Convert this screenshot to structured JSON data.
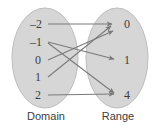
{
  "figure": {
    "type": "mapping-diagram",
    "partial_top_text": "",
    "width": 155,
    "height": 128,
    "background_color": "#ffffff",
    "ellipse_fill": "#d6d6d6",
    "ellipse_stroke": "#bdbdbd",
    "arrow_color": "#7a7a7a",
    "text_color": "#3d3d3d"
  },
  "domain": {
    "caption": "Domain",
    "center_x": 45,
    "center_y": 58,
    "radius_x": 33,
    "radius_y": 50,
    "items": [
      {
        "label": "–2",
        "x": 34,
        "y": 24
      },
      {
        "label": "–1",
        "x": 34,
        "y": 42
      },
      {
        "label": "0",
        "x": 38,
        "y": 60
      },
      {
        "label": "1",
        "x": 38,
        "y": 77
      },
      {
        "label": "2",
        "x": 38,
        "y": 95
      }
    ]
  },
  "range": {
    "caption": "Range",
    "center_x": 117,
    "center_y": 58,
    "radius_x": 31,
    "radius_y": 50,
    "items": [
      {
        "label": "0",
        "x": 126,
        "y": 24
      },
      {
        "label": "1",
        "x": 126,
        "y": 60
      },
      {
        "label": "4",
        "x": 126,
        "y": 95
      }
    ]
  },
  "mappings": [
    {
      "from": "–2",
      "to": "0",
      "x1": 48,
      "y1": 24,
      "x2": 116,
      "y2": 24
    },
    {
      "from": "–1",
      "to": "1",
      "x1": 48,
      "y1": 42,
      "x2": 118,
      "y2": 60
    },
    {
      "from": "0",
      "to": "0",
      "x1": 48,
      "y1": 60,
      "x2": 116,
      "y2": 32
    },
    {
      "from": "1",
      "to": "0",
      "x1": 48,
      "y1": 77,
      "x2": 114,
      "y2": 28
    },
    {
      "from": "2",
      "to": "4",
      "x1": 48,
      "y1": 95,
      "x2": 118,
      "y2": 95
    },
    {
      "from": "–1-cross",
      "to": "4",
      "x1": 48,
      "y1": 42,
      "x2": 118,
      "y2": 95
    }
  ],
  "captions": {
    "domain_label_x": 46,
    "domain_label_y": 112,
    "range_label_x": 117,
    "range_label_y": 112
  }
}
